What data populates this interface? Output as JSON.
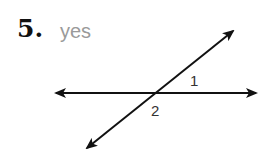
{
  "problem": {
    "number": "5.",
    "answer": "yes"
  },
  "diagram": {
    "angle_labels": [
      "1",
      "2"
    ],
    "stroke_color": "#111111"
  }
}
